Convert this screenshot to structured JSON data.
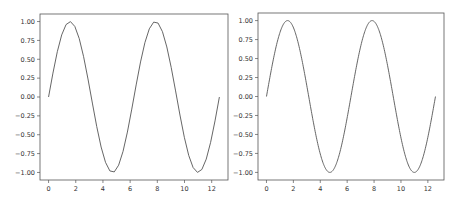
{
  "chart_data": [
    {
      "type": "line",
      "title": "",
      "xlabel": "",
      "ylabel": "",
      "xlim": [
        -0.63,
        13.2
      ],
      "ylim": [
        -1.1,
        1.1
      ],
      "grid": false,
      "function": "sin(x)",
      "x_range": [
        0,
        12.566
      ],
      "num_points": 40,
      "xticks": [
        0,
        2,
        4,
        6,
        8,
        10,
        12
      ],
      "xtick_labels": [
        "0",
        "2",
        "4",
        "6",
        "8",
        "10",
        "12"
      ],
      "yticks": [
        1.0,
        0.75,
        0.5,
        0.25,
        0.0,
        -0.25,
        -0.5,
        -0.75,
        -1.0
      ],
      "ytick_labels": [
        "1.00",
        "0.75",
        "0.50",
        "0.25",
        "0.00",
        "−0.25",
        "−0.50",
        "−0.75",
        "−1.00"
      ],
      "series": [
        {
          "name": "sin",
          "color": "#555555"
        }
      ]
    },
    {
      "type": "line",
      "title": "",
      "xlabel": "",
      "ylabel": "",
      "xlim": [
        -0.63,
        13.2
      ],
      "ylim": [
        -1.1,
        1.1
      ],
      "grid": false,
      "function": "sin(x)",
      "x_range": [
        0,
        12.566
      ],
      "num_points": 400,
      "xticks": [
        0,
        2,
        4,
        6,
        8,
        10,
        12
      ],
      "xtick_labels": [
        "0",
        "2",
        "4",
        "6",
        "8",
        "10",
        "12"
      ],
      "yticks": [
        1.0,
        0.75,
        0.5,
        0.25,
        0.0,
        -0.25,
        -0.5,
        -0.75,
        -1.0
      ],
      "ytick_labels": [
        "1.00",
        "0.75",
        "0.50",
        "0.25",
        "0.00",
        "−0.25",
        "−0.50",
        "−0.75",
        "−1.00"
      ],
      "series": [
        {
          "name": "sin",
          "color": "#555555"
        }
      ]
    }
  ]
}
